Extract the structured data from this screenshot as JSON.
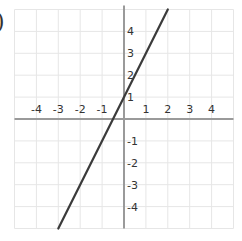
{
  "label_prefix": ")",
  "chart_data": {
    "type": "line",
    "title": "",
    "xlabel": "",
    "ylabel": "",
    "equation": "y = 2x + 1",
    "x_ticks": [
      -4,
      -3,
      -2,
      -1,
      1,
      2,
      3,
      4
    ],
    "y_ticks": [
      4,
      3,
      2,
      1,
      -1,
      -2,
      -3,
      -4
    ],
    "x_tick_labels": [
      "-4",
      "-3",
      "-2",
      "-1",
      "1",
      "2",
      "3",
      "4"
    ],
    "y_tick_labels": [
      "4",
      "3",
      "2",
      "1",
      "-1",
      "-2",
      "-3",
      "-4"
    ],
    "xlim": [
      -5,
      5
    ],
    "ylim": [
      -5,
      5
    ],
    "grid": true,
    "legend": null,
    "series": [
      {
        "name": "line",
        "slope": 2,
        "intercept": 1,
        "x": [
          -3,
          -2,
          -1,
          0,
          1,
          2
        ],
        "y": [
          -5,
          -3,
          -1,
          1,
          3,
          5
        ]
      }
    ],
    "colors": {
      "grid": "#e6e6e6",
      "axis": "#9a9a9a",
      "line": "#3a3a3a",
      "label": "#333333"
    }
  }
}
